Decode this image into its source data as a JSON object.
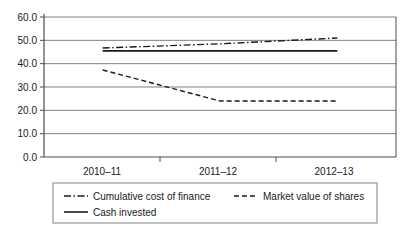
{
  "chart_data": {
    "type": "line",
    "title": "",
    "xlabel": "",
    "ylabel": "",
    "categories": [
      "2010–11",
      "2011–12",
      "2012–13"
    ],
    "ylim": [
      0.0,
      60.0
    ],
    "yticks": [
      "0.0",
      "10.0",
      "20.0",
      "30.0",
      "40.0",
      "50.0",
      "60.0"
    ],
    "ytick_values": [
      0.0,
      10.0,
      20.0,
      30.0,
      40.0,
      50.0,
      60.0
    ],
    "grid": true,
    "legend_position": "bottom",
    "series": [
      {
        "name": "Cumulative cost of finance",
        "style": "dash-dot",
        "color": "#1a1a1a",
        "values": [
          46.7,
          48.5,
          51.0
        ]
      },
      {
        "name": "Market value of shares",
        "style": "dashed",
        "color": "#1a1a1a",
        "values": [
          37.3,
          24.0,
          24.0
        ]
      },
      {
        "name": "Cash invested",
        "style": "solid",
        "color": "#1a1a1a",
        "values": [
          45.5,
          45.5,
          45.5
        ]
      }
    ]
  },
  "legend": {
    "entries": [
      {
        "label": "Cumulative cost of finance",
        "style": "dash-dot"
      },
      {
        "label": "Market value of shares",
        "style": "dashed"
      },
      {
        "label": "Cash invested",
        "style": "solid"
      }
    ]
  },
  "colors": {
    "axis": "#4d4d4d",
    "grid": "#808080",
    "series": "#1a1a1a",
    "legend_border": "#808080",
    "background": "#ffffff"
  }
}
